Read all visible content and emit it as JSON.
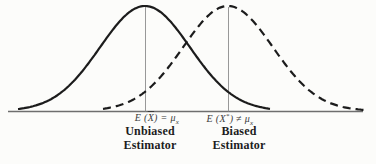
{
  "figure": {
    "background": "#fcfcfa",
    "curve_color": "#1c1c1c",
    "axis_color": "#6e6e6e",
    "mean_line_color": "#8c8c8c"
  },
  "geometry": {
    "axis_x1": 8,
    "axis_x2": 363,
    "axis_y": 111.5,
    "baseline_y": 111,
    "peak_height": 105
  },
  "curves": [
    {
      "id": "unbiased",
      "style": "solid",
      "peak_x": 145,
      "sigma": 45,
      "start": 18,
      "end": 270
    },
    {
      "id": "biased",
      "style": "dashed",
      "peak_x": 228,
      "sigma": 45,
      "start": 103,
      "end": 369
    }
  ],
  "labels": {
    "unbiased_math": {
      "body1": "E (",
      "xbar": "X",
      "body2": ") = μ",
      "sub": "x"
    },
    "biased_math": {
      "body1": "E (X",
      "sup": "*",
      "body2": ") ≠ μ",
      "sub": "x"
    },
    "unbiased_name": {
      "line1": "Unbiased",
      "line2": "Estimator"
    },
    "biased_name": {
      "line1": "Biased",
      "line2": "Estimator"
    }
  }
}
